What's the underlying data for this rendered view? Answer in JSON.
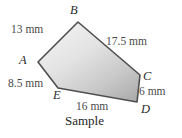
{
  "figure": {
    "caption": "Sample",
    "shape_type": "pentagon",
    "fill_color": "#cfcfcf",
    "stroke_color": "#4a4a4a",
    "vertices": [
      {
        "name": "A",
        "label": "A",
        "x": 38,
        "y": 62
      },
      {
        "name": "B",
        "label": "B",
        "x": 78,
        "y": 22
      },
      {
        "name": "C",
        "label": "C",
        "x": 140,
        "y": 75
      },
      {
        "name": "D",
        "label": "D",
        "x": 137,
        "y": 102
      },
      {
        "name": "E",
        "label": "E",
        "x": 58,
        "y": 88
      }
    ],
    "sides": [
      {
        "from": "A",
        "to": "B",
        "label": "13 mm",
        "value": 13,
        "unit": "mm"
      },
      {
        "from": "B",
        "to": "C",
        "label": "17.5 mm",
        "value": 17.5,
        "unit": "mm"
      },
      {
        "from": "C",
        "to": "D",
        "label": "6 mm",
        "value": 6,
        "unit": "mm"
      },
      {
        "from": "D",
        "to": "E",
        "label": "16 mm",
        "value": 16,
        "unit": "mm"
      },
      {
        "from": "E",
        "to": "A",
        "label": "8.5 mm",
        "value": 8.5,
        "unit": "mm"
      }
    ]
  }
}
